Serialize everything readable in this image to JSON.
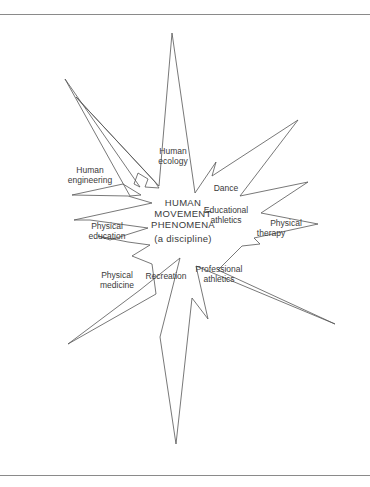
{
  "diagram": {
    "type": "starburst",
    "center": {
      "line1": "HUMAN",
      "line2": "MOVEMENT",
      "line3": "PHENOMENA",
      "line4": "(a discipline)"
    },
    "fields": [
      {
        "id": "human-ecology",
        "line1": "Human",
        "line2": "ecology"
      },
      {
        "id": "human-engineering",
        "line1": "Human",
        "line2": "engineering"
      },
      {
        "id": "dance",
        "line1": "Dance"
      },
      {
        "id": "educational-athletics",
        "line1": "Educational",
        "line2": "athletics"
      },
      {
        "id": "physical-therapy",
        "line1": "Physical",
        "line2": "therapy"
      },
      {
        "id": "physical-education",
        "line1": "Physical",
        "line2": "education"
      },
      {
        "id": "physical-medicine",
        "line1": "Physical",
        "line2": "medicine"
      },
      {
        "id": "recreation",
        "line1": "Recreation"
      },
      {
        "id": "professional-athletics",
        "line1": "Professional",
        "line2": "athletics"
      }
    ],
    "line_color": "#555555"
  }
}
